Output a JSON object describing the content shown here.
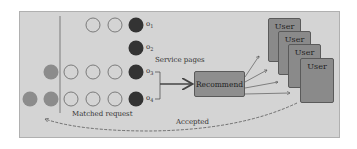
{
  "diagram": {
    "queue": {
      "rows": [
        {
          "label": "o1",
          "hollow": 2,
          "waiting": 0
        },
        {
          "label": "o2",
          "hollow": 0,
          "waiting": 0
        },
        {
          "label": "o3",
          "hollow": 3,
          "waiting": 1
        },
        {
          "label": "o4",
          "hollow": 3,
          "waiting": 2
        }
      ],
      "output_labels": [
        "o",
        "o",
        "o",
        "o"
      ],
      "output_subscripts": [
        "1",
        "2",
        "3",
        "4"
      ]
    },
    "service_pages_label": "Service pages",
    "recommend_label": "Recommend",
    "users": [
      "User",
      "User",
      "User",
      "User"
    ],
    "matched_requests_label": "Matched request",
    "accepted_label": "Accepted",
    "colors": {
      "background": "#d4d4d4",
      "dark_circle": "#333333",
      "gray_circle": "#8c8c8c",
      "box_fill": "#8a8a8a"
    }
  }
}
